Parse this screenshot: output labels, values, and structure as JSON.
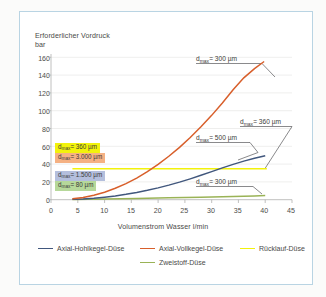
{
  "figure": {
    "frame_color": "#b9d4e3",
    "background": "#ffffff"
  },
  "chart_data": {
    "type": "line",
    "title": "",
    "ylabel_line1": "Erforderlicher Vordruck",
    "ylabel_line2": "bar",
    "xlabel": "Volumenstrom Wasser l/min",
    "xlim": [
      0,
      45
    ],
    "ylim": [
      0,
      165
    ],
    "xticks": [
      0,
      5,
      10,
      15,
      20,
      25,
      30,
      35,
      40,
      45
    ],
    "yticks": [
      0,
      20,
      40,
      60,
      80,
      100,
      120,
      140,
      160
    ],
    "grid": "horizontal",
    "legend_position": "bottom",
    "series": [
      {
        "name": "Axial-Hohlkegel-Düse",
        "color": "#41577d",
        "points": [
          [
            4.0,
            0.4
          ],
          [
            6,
            0.9
          ],
          [
            8,
            1.7
          ],
          [
            10,
            2.9
          ],
          [
            12,
            4.3
          ],
          [
            14,
            6.1
          ],
          [
            16,
            8.2
          ],
          [
            18,
            10.6
          ],
          [
            20,
            13.4
          ],
          [
            22,
            16.5
          ],
          [
            24,
            19.9
          ],
          [
            26,
            23.6
          ],
          [
            28,
            27.6
          ],
          [
            30,
            31.8
          ],
          [
            32,
            36.0
          ],
          [
            34,
            40.0
          ],
          [
            36,
            43.7
          ],
          [
            38,
            47.0
          ],
          [
            40,
            49.8
          ]
        ]
      },
      {
        "name": "Axial-Vollkegel-Düse",
        "color": "#d85f2b",
        "points": [
          [
            4.0,
            1.0
          ],
          [
            6,
            2.6
          ],
          [
            8,
            5.1
          ],
          [
            10,
            8.5
          ],
          [
            12,
            12.9
          ],
          [
            14,
            18.2
          ],
          [
            16,
            24.5
          ],
          [
            18,
            31.8
          ],
          [
            20,
            40.0
          ],
          [
            22,
            49.2
          ],
          [
            24,
            59.3
          ],
          [
            26,
            70.4
          ],
          [
            28,
            82.5
          ],
          [
            30,
            95.5
          ],
          [
            32,
            109.5
          ],
          [
            34,
            124.4
          ],
          [
            36,
            138.0
          ],
          [
            38,
            148.5
          ],
          [
            39.8,
            156.5
          ]
        ]
      },
      {
        "name": "Rücklauf-Düse",
        "color": "#f2f20c",
        "points": [
          [
            4.0,
            35.0
          ],
          [
            40.3,
            35.0
          ]
        ]
      },
      {
        "name": "Zweistoff-Düse",
        "color": "#9ab356",
        "points": [
          [
            4.0,
            0.3
          ],
          [
            10,
            0.9
          ],
          [
            16,
            1.5
          ],
          [
            22,
            2.1
          ],
          [
            28,
            2.8
          ],
          [
            34,
            3.6
          ],
          [
            38,
            4.3
          ],
          [
            40.0,
            4.7
          ]
        ]
      }
    ],
    "highlight_labels": [
      {
        "text": "d",
        "sub": "max",
        "rest": "= 360 µm",
        "style": "yellow"
      },
      {
        "text": "d",
        "sub": "max",
        "rest": "= 3.000 µm",
        "style": "orange"
      },
      {
        "text": "d",
        "sub": "max",
        "rest": "= 1.500 µm",
        "style": "blue"
      },
      {
        "text": "d",
        "sub": "max",
        "rest": "= 80 µm",
        "style": "green"
      }
    ],
    "annotations": [
      {
        "text": "d",
        "sub": "max",
        "rest": "= 300 µm",
        "target_series": "Axial-Vollkegel-Düse"
      },
      {
        "text": "d",
        "sub": "max",
        "rest": "= 360 µm",
        "target_series": "Rücklauf-Düse"
      },
      {
        "text": "d",
        "sub": "max",
        "rest": "= 500 µm",
        "target_series": "Axial-Hohlkegel-Düse"
      },
      {
        "text": "d",
        "sub": "max",
        "rest": "= 300 µm",
        "target_series": "Zweistoff-Düse"
      }
    ]
  }
}
